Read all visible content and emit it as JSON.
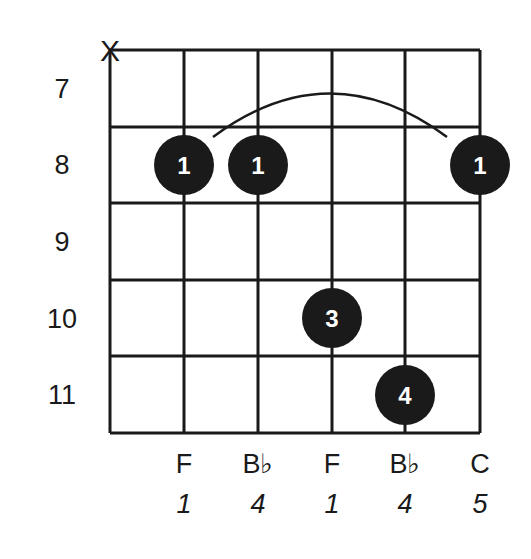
{
  "diagram": {
    "type": "guitar-chord-diagram",
    "muted_strings": [
      {
        "string": 6,
        "symbol": "X"
      }
    ],
    "frets": [
      "7",
      "8",
      "9",
      "10",
      "11"
    ],
    "barre": {
      "fret": "8",
      "from_string": 5,
      "to_string": 1,
      "finger": "1"
    },
    "dots": [
      {
        "string": 5,
        "fret": "8",
        "finger": "1"
      },
      {
        "string": 4,
        "fret": "8",
        "finger": "1"
      },
      {
        "string": 3,
        "fret": "10",
        "finger": "3"
      },
      {
        "string": 2,
        "fret": "11",
        "finger": "4"
      },
      {
        "string": 1,
        "fret": "8",
        "finger": "1"
      }
    ],
    "notes": [
      "F",
      "B♭",
      "F",
      "B♭",
      "C"
    ],
    "intervals": [
      "1",
      "4",
      "1",
      "4",
      "5"
    ],
    "colors": {
      "line": "#1a1a1a",
      "dot": "#1a1a1a",
      "dot_text": "#ffffff",
      "background": "#ffffff"
    }
  }
}
